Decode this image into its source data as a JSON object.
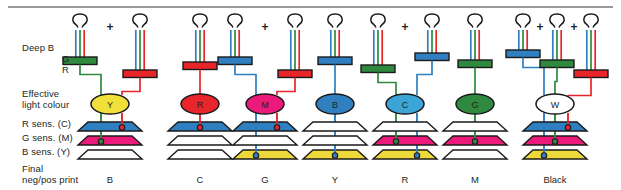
{
  "figure": {
    "rule_color": "#9a9a9a"
  },
  "row_labels": [
    {
      "id": "deep-b",
      "text": "Deep B",
      "x": 22,
      "y": 42,
      "align": "left"
    },
    {
      "id": "deep-g",
      "text": "G",
      "x": 22,
      "y": 53,
      "align": "right-indent"
    },
    {
      "id": "deep-r",
      "text": "R",
      "x": 22,
      "y": 64,
      "align": "right-indent"
    },
    {
      "id": "effective-1",
      "text": "Effective",
      "x": 22,
      "y": 88,
      "align": "left"
    },
    {
      "id": "effective-2",
      "text": "light colour",
      "x": 22,
      "y": 99,
      "align": "left"
    },
    {
      "id": "r-sens",
      "text": "R sens. (C)",
      "x": 22,
      "y": 118,
      "align": "left"
    },
    {
      "id": "g-sens",
      "text": "G sens. (M)",
      "x": 22,
      "y": 132,
      "align": "left"
    },
    {
      "id": "b-sens",
      "text": "B sens. (Y)",
      "x": 22,
      "y": 146,
      "align": "left"
    },
    {
      "id": "final-1",
      "text": "Final",
      "x": 22,
      "y": 163,
      "align": "left"
    },
    {
      "id": "final-2",
      "text": "neg/pos print",
      "x": 22,
      "y": 174,
      "align": "left"
    }
  ],
  "palette": {
    "blue": "#2f7fc1",
    "green": "#2f8a3f",
    "red": "#e8252a",
    "yellow": "#f2e03a",
    "magenta": "#ec1a7b",
    "cyan": "#3aa5d6",
    "white": "#ffffff",
    "outline": "#1a1a1a",
    "text": "#231f20",
    "layer_blue": "#2f7fc1",
    "layer_magenta": "#ec1a7b",
    "layer_yellow": "#edd93a",
    "layer_clear": "#ffffff"
  },
  "columns": [
    {
      "id": "col-b",
      "center": 110,
      "bottom_label": "B",
      "effective": {
        "label": "Y",
        "fill": "#f2e03a"
      },
      "lamps": [
        {
          "x": 80,
          "filter": {
            "color": "#2f8a3f",
            "name": "green-filter",
            "width": 34,
            "y": 57,
            "cx": 80
          }
        },
        {
          "x": 140,
          "filter": {
            "color": "#e8252a",
            "name": "red-filter",
            "width": 34,
            "y": 70,
            "cx": 140
          }
        }
      ],
      "plus_between": [
        {
          "x": 110,
          "y": 20
        }
      ],
      "layers": [
        {
          "name": "r-sens-c",
          "fill": "#2f7fc1"
        },
        {
          "name": "g-sens-m",
          "fill": "#ec1a7b"
        },
        {
          "name": "b-sens-y",
          "fill": "#ffffff"
        }
      ],
      "drops": [
        {
          "color": "#2f8a3f",
          "layer": 1,
          "x": 101
        },
        {
          "color": "#e8252a",
          "layer": 0,
          "x": 122
        }
      ]
    },
    {
      "id": "col-c",
      "center": 200,
      "bottom_label": "C",
      "effective": {
        "label": "R",
        "fill": "#e8252a"
      },
      "lamps": [
        {
          "x": 200,
          "filter": {
            "color": "#e8252a",
            "name": "red-filter",
            "width": 34,
            "y": 62,
            "cx": 200
          }
        }
      ],
      "plus_between": [],
      "layers": [
        {
          "name": "r-sens-c",
          "fill": "#2f7fc1"
        },
        {
          "name": "g-sens-m",
          "fill": "#ffffff"
        },
        {
          "name": "b-sens-y",
          "fill": "#ffffff"
        }
      ],
      "drops": [
        {
          "color": "#e8252a",
          "layer": 0,
          "x": 200
        }
      ]
    },
    {
      "id": "col-g",
      "center": 265,
      "bottom_label": "G",
      "effective": {
        "label": "M",
        "fill": "#ec1a7b"
      },
      "lamps": [
        {
          "x": 235,
          "filter": {
            "color": "#2f7fc1",
            "name": "blue-filter",
            "width": 34,
            "y": 57,
            "cx": 235
          }
        },
        {
          "x": 295,
          "filter": {
            "color": "#e8252a",
            "name": "red-filter",
            "width": 34,
            "y": 70,
            "cx": 295
          }
        }
      ],
      "plus_between": [
        {
          "x": 265,
          "y": 20
        }
      ],
      "layers": [
        {
          "name": "r-sens-c",
          "fill": "#2f7fc1"
        },
        {
          "name": "g-sens-m",
          "fill": "#ffffff"
        },
        {
          "name": "b-sens-y",
          "fill": "#edd93a"
        }
      ],
      "drops": [
        {
          "color": "#2f7fc1",
          "layer": 2,
          "x": 256
        },
        {
          "color": "#e8252a",
          "layer": 0,
          "x": 277
        }
      ]
    },
    {
      "id": "col-y",
      "center": 335,
      "bottom_label": "Y",
      "effective": {
        "label": "B",
        "fill": "#2f7fc1"
      },
      "lamps": [
        {
          "x": 335,
          "filter": {
            "color": "#2f7fc1",
            "name": "blue-filter",
            "width": 34,
            "y": 57,
            "cx": 335
          }
        }
      ],
      "plus_between": [],
      "layers": [
        {
          "name": "r-sens-c",
          "fill": "#ffffff"
        },
        {
          "name": "g-sens-m",
          "fill": "#ffffff"
        },
        {
          "name": "b-sens-y",
          "fill": "#edd93a"
        }
      ],
      "drops": [
        {
          "color": "#2f7fc1",
          "layer": 2,
          "x": 335
        }
      ]
    },
    {
      "id": "col-r",
      "center": 405,
      "bottom_label": "R",
      "effective": {
        "label": "C",
        "fill": "#3aa5d6"
      },
      "lamps": [
        {
          "x": 378,
          "filter": {
            "color": "#2f8a3f",
            "name": "green-filter",
            "width": 34,
            "y": 65,
            "cx": 378
          }
        },
        {
          "x": 432,
          "filter": {
            "color": "#2f7fc1",
            "name": "blue-filter",
            "width": 34,
            "y": 53,
            "cx": 432
          }
        }
      ],
      "plus_between": [
        {
          "x": 405,
          "y": 20
        }
      ],
      "layers": [
        {
          "name": "r-sens-c",
          "fill": "#ffffff"
        },
        {
          "name": "g-sens-m",
          "fill": "#ec1a7b"
        },
        {
          "name": "b-sens-y",
          "fill": "#edd93a"
        }
      ],
      "drops": [
        {
          "color": "#2f8a3f",
          "layer": 1,
          "x": 396
        },
        {
          "color": "#2f7fc1",
          "layer": 2,
          "x": 417
        }
      ]
    },
    {
      "id": "col-m",
      "center": 475,
      "bottom_label": "M",
      "effective": {
        "label": "G",
        "fill": "#2f8a3f"
      },
      "lamps": [
        {
          "x": 475,
          "filter": {
            "color": "#2f8a3f",
            "name": "green-filter",
            "width": 34,
            "y": 60,
            "cx": 475
          }
        }
      ],
      "plus_between": [],
      "layers": [
        {
          "name": "r-sens-c",
          "fill": "#ffffff"
        },
        {
          "name": "g-sens-m",
          "fill": "#ec1a7b"
        },
        {
          "name": "b-sens-y",
          "fill": "#ffffff"
        }
      ],
      "drops": [
        {
          "color": "#2f8a3f",
          "layer": 1,
          "x": 475
        }
      ]
    },
    {
      "id": "col-black",
      "center": 555,
      "bottom_label": "Black",
      "effective": {
        "label": "W",
        "fill": "#ffffff"
      },
      "lamps": [
        {
          "x": 523,
          "filter": {
            "color": "#2f7fc1",
            "name": "blue-filter",
            "width": 34,
            "y": 50,
            "cx": 523
          }
        },
        {
          "x": 557,
          "filter": {
            "color": "#2f8a3f",
            "name": "green-filter",
            "width": 34,
            "y": 60,
            "cx": 557
          }
        },
        {
          "x": 591,
          "filter": {
            "color": "#e8252a",
            "name": "red-filter",
            "width": 34,
            "y": 70,
            "cx": 591
          }
        }
      ],
      "plus_between": [
        {
          "x": 540,
          "y": 20
        },
        {
          "x": 574,
          "y": 20
        }
      ],
      "layers": [
        {
          "name": "r-sens-c",
          "fill": "#2f7fc1"
        },
        {
          "name": "g-sens-m",
          "fill": "#ec1a7b"
        },
        {
          "name": "b-sens-y",
          "fill": "#edd93a"
        }
      ],
      "drops": [
        {
          "color": "#2f7fc1",
          "layer": 2,
          "x": 544
        },
        {
          "color": "#2f8a3f",
          "layer": 1,
          "x": 555
        },
        {
          "color": "#e8252a",
          "layer": 0,
          "x": 568
        }
      ]
    }
  ],
  "geometry": {
    "bulb_top": 14,
    "ray_top": 30,
    "ellipse_cy": 104,
    "ellipse_rx": 19,
    "ellipse_ry": 10,
    "layer_y": [
      122,
      136,
      150
    ],
    "layer_half_top": 22,
    "layer_half_bottom": 32,
    "layer_thickness": 9,
    "bottom_label_y": 174
  }
}
